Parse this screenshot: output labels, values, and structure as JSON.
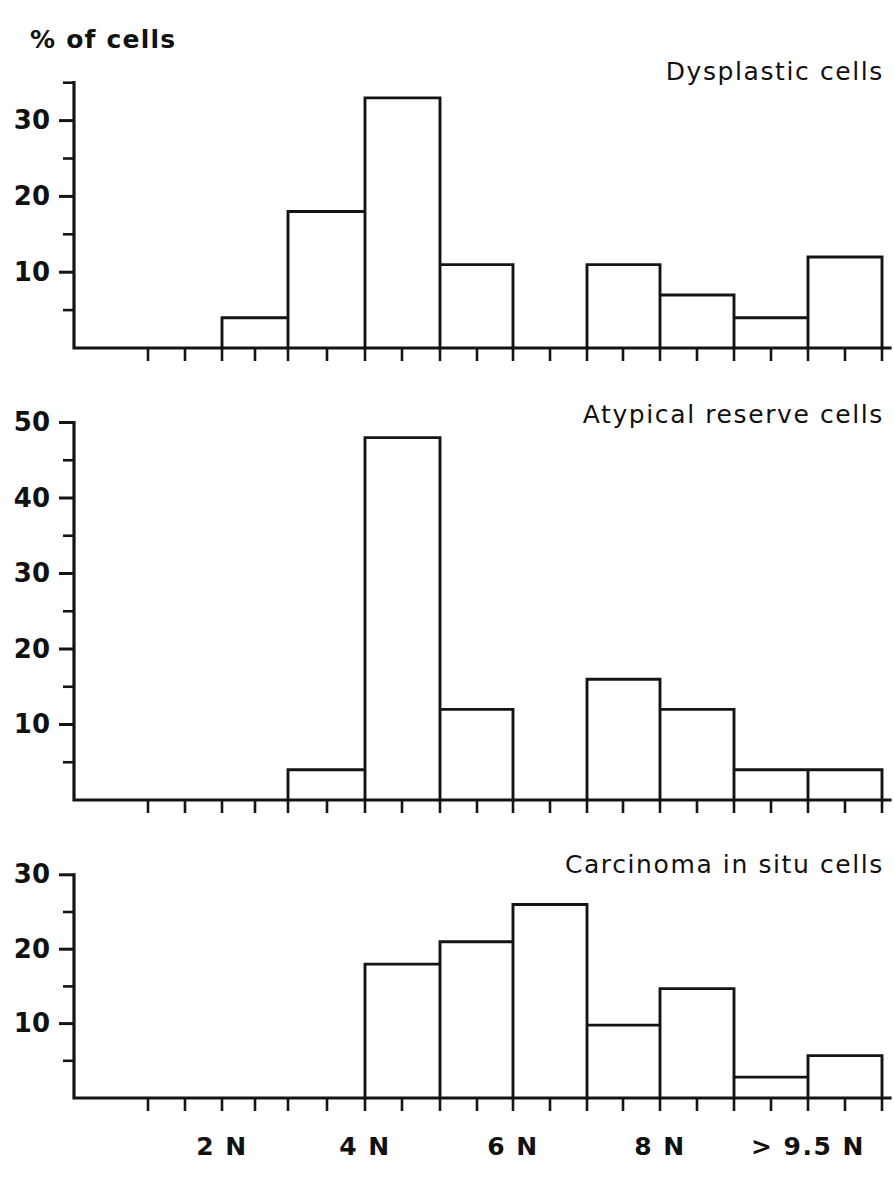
{
  "figure": {
    "axis_caption": "% of cells",
    "background": "#ffffff",
    "ink_color": "#141414"
  },
  "x_axis": {
    "tick_labels": [
      "2 N",
      "4 N",
      "6 N",
      "8 N",
      "> 9.5 N"
    ],
    "label_positions": [
      222,
      365,
      513,
      660,
      808
    ],
    "major_ticks": [
      148,
      222,
      288,
      365,
      440,
      513,
      587,
      660,
      734,
      808,
      882
    ],
    "minor_ticks": [
      185,
      255,
      327,
      402,
      477,
      550,
      623,
      697,
      771,
      845
    ],
    "start": 74,
    "end": 890
  },
  "chart_data": [
    {
      "type": "bar",
      "title": "Dysplastic cells",
      "xlabel": "",
      "ylabel": "% of cells",
      "ylim": [
        0,
        35
      ],
      "yticks_major": [
        10,
        20,
        30
      ],
      "yticks_minor": [
        5,
        15,
        25,
        35
      ],
      "ytick_labels": [
        "10",
        "20",
        "30"
      ],
      "grid": false,
      "categories": [
        "2N",
        "3N",
        "4N",
        "5N",
        "6N",
        "7N",
        "8N",
        "9N",
        ">9.5N"
      ],
      "bar_edges": [
        148,
        222,
        288,
        365,
        440,
        513,
        587,
        660,
        734,
        808,
        882
      ],
      "values": [
        0,
        4,
        18,
        33,
        11,
        0,
        11,
        7,
        4,
        12
      ]
    },
    {
      "type": "bar",
      "title": "Atypical reserve cells",
      "xlabel": "",
      "ylabel": "",
      "ylim": [
        0,
        52
      ],
      "yticks_major": [
        10,
        20,
        30,
        40,
        50
      ],
      "yticks_minor": [
        5,
        15,
        25,
        35,
        45
      ],
      "ytick_labels": [
        "10",
        "20",
        "30",
        "40",
        "50"
      ],
      "grid": false,
      "categories": [
        "2N",
        "3N",
        "4N",
        "5N",
        "6N",
        "7N",
        "8N",
        "9N",
        ">9.5N"
      ],
      "bar_edges": [
        148,
        222,
        288,
        365,
        440,
        513,
        587,
        660,
        734,
        808,
        882
      ],
      "values": [
        0,
        0,
        4,
        48,
        12,
        0,
        16,
        12,
        4,
        4
      ]
    },
    {
      "type": "bar",
      "title": "Carcinoma in situ cells",
      "xlabel": "",
      "ylabel": "",
      "ylim": [
        0,
        31
      ],
      "yticks_major": [
        10,
        20,
        30
      ],
      "yticks_minor": [
        5,
        15,
        25
      ],
      "ytick_labels": [
        "10",
        "20",
        "30"
      ],
      "grid": false,
      "categories": [
        "2N",
        "3N",
        "4N",
        "5N",
        "6N",
        "7N",
        "8N",
        "9N",
        ">9.5N"
      ],
      "bar_edges": [
        148,
        222,
        288,
        365,
        440,
        513,
        587,
        660,
        734,
        808,
        882
      ],
      "values": [
        0,
        0,
        0,
        18,
        21,
        26,
        9.8,
        14.7,
        2.8,
        5.7
      ]
    }
  ]
}
